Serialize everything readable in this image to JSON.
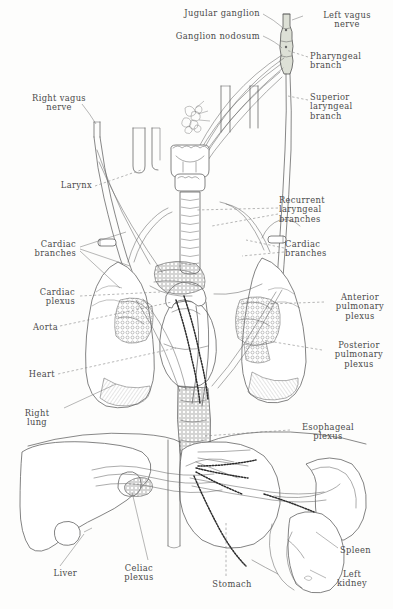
{
  "figure": {
    "type": "anatomical-illustration",
    "style": "pen-and-ink line drawing, hand lettering",
    "background_color": "#fdfdfc",
    "ink_color": "#4a4a4a",
    "ganglion_fill": "#d9ddd2"
  },
  "labels": [
    {
      "id": "jugular-ganglion",
      "text": "Jugular ganglion",
      "x": 152,
      "y": 9,
      "align": "right",
      "width": 108
    },
    {
      "id": "ganglion-nodosum",
      "text": "Ganglion nodosum",
      "x": 151,
      "y": 32,
      "align": "right",
      "width": 109
    },
    {
      "id": "left-vagus-nerve",
      "text": "Left vagus\nnerve",
      "x": 305,
      "y": 11,
      "align": "left",
      "width": 84
    },
    {
      "id": "pharyngeal-branch",
      "text": "Pharyngeal\nbranch",
      "x": 310,
      "y": 52,
      "align": "left",
      "width": 80
    },
    {
      "id": "superior-laryngeal-branch",
      "text": "Superior\nlaryngeal\nbranch",
      "x": 310,
      "y": 93,
      "align": "left",
      "width": 78
    },
    {
      "id": "right-vagus-nerve",
      "text": "Right vagus\nnerve",
      "x": 18,
      "y": 94,
      "align": "left",
      "width": 82
    },
    {
      "id": "larynx",
      "text": "Larynx",
      "x": 44,
      "y": 181,
      "align": "left",
      "width": 48
    },
    {
      "id": "recurrent-laryngeal-branches",
      "text": "Recurrent\nlaryngeal\nbranches",
      "x": 279,
      "y": 196,
      "align": "left",
      "width": 84
    },
    {
      "id": "cardiac-branches-left",
      "text": "Cardiac\nbranches",
      "x": 14,
      "y": 240,
      "align": "left",
      "width": 62
    },
    {
      "id": "cardiac-branches-right",
      "text": "Cardiac\nbranches",
      "x": 285,
      "y": 240,
      "align": "left",
      "width": 66
    },
    {
      "id": "cardiac-plexus",
      "text": "Cardiac\nplexus",
      "x": 15,
      "y": 288,
      "align": "left",
      "width": 60
    },
    {
      "id": "anterior-pulmonary-plexus",
      "text": "Anterior\npulmonary\nplexus",
      "x": 326,
      "y": 293,
      "align": "left",
      "width": 68
    },
    {
      "id": "aorta",
      "text": "Aorta",
      "x": 16,
      "y": 323,
      "align": "left",
      "width": 42
    },
    {
      "id": "posterior-pulmonary-plexus",
      "text": "Posterior\npulmonary\nplexus",
      "x": 325,
      "y": 341,
      "align": "left",
      "width": 68
    },
    {
      "id": "heart",
      "text": "Heart",
      "x": 15,
      "y": 370,
      "align": "left",
      "width": 40
    },
    {
      "id": "right-lung",
      "text": "Right\nlung",
      "x": 16,
      "y": 409,
      "align": "left",
      "width": 42
    },
    {
      "id": "esophageal-plexus",
      "text": "Esophageal\nplexus",
      "x": 291,
      "y": 423,
      "align": "left",
      "width": 74
    },
    {
      "id": "liver",
      "text": "Liver",
      "x": 37,
      "y": 569,
      "align": "left",
      "width": 40
    },
    {
      "id": "celiac-plexus",
      "text": "Celiac\nplexus",
      "x": 113,
      "y": 564,
      "align": "left",
      "width": 52
    },
    {
      "id": "stomach",
      "text": "Stomach",
      "x": 204,
      "y": 580,
      "align": "left",
      "width": 56
    },
    {
      "id": "spleen",
      "text": "Spleen",
      "x": 340,
      "y": 546,
      "align": "left",
      "width": 48
    },
    {
      "id": "left-kidney",
      "text": "Left\nkidney",
      "x": 327,
      "y": 570,
      "align": "left",
      "width": 50
    }
  ],
  "structures": [
    {
      "id": "jugular-ganglion-node",
      "name": "jugular ganglion"
    },
    {
      "id": "nodose-ganglion-node",
      "name": "ganglion nodosum"
    },
    {
      "id": "larynx-structure",
      "name": "larynx"
    },
    {
      "id": "trachea-structure",
      "name": "trachea"
    },
    {
      "id": "left-lung-structure",
      "name": "left lung"
    },
    {
      "id": "right-lung-structure",
      "name": "right lung"
    },
    {
      "id": "heart-structure",
      "name": "heart"
    },
    {
      "id": "aorta-structure",
      "name": "aorta"
    },
    {
      "id": "esophagus-structure",
      "name": "esophagus"
    },
    {
      "id": "liver-structure",
      "name": "liver"
    },
    {
      "id": "stomach-structure",
      "name": "stomach"
    },
    {
      "id": "spleen-structure",
      "name": "spleen"
    },
    {
      "id": "left-kidney-structure",
      "name": "left kidney"
    },
    {
      "id": "celiac-plexus-structure",
      "name": "celiac plexus"
    }
  ]
}
